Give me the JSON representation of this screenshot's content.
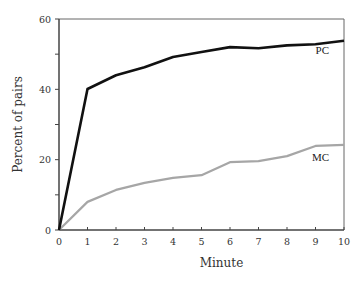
{
  "chart_data": {
    "type": "line",
    "title": "",
    "xlabel": "Minute",
    "ylabel": "Percent of pairs",
    "xlim": [
      0,
      10
    ],
    "ylim": [
      0,
      60
    ],
    "x_ticks": [
      0,
      1,
      2,
      3,
      4,
      5,
      6,
      7,
      8,
      9,
      10
    ],
    "x_tick_labels": [
      "0",
      "1",
      "2",
      "3",
      "4",
      "5",
      "6",
      "7",
      "8",
      "9",
      "10"
    ],
    "y_ticks": [
      0,
      10,
      20,
      30,
      40,
      50,
      60
    ],
    "y_tick_labels": [
      "0",
      "",
      "20",
      "",
      "40",
      "",
      "60"
    ],
    "grid": false,
    "legend": "inline-labels-right",
    "x": [
      0,
      1,
      2,
      3,
      4,
      5,
      6,
      7,
      8,
      9,
      10
    ],
    "series": [
      {
        "name": "PC",
        "color": "#111111",
        "values": [
          0,
          40.1,
          44.0,
          46.3,
          49.2,
          50.6,
          52.0,
          51.7,
          52.5,
          52.8,
          53.8
        ]
      },
      {
        "name": "MC",
        "color": "#a6a6a6",
        "values": [
          0,
          8.0,
          11.4,
          13.4,
          14.8,
          15.6,
          19.3,
          19.6,
          21.0,
          23.9,
          24.2
        ]
      }
    ]
  }
}
